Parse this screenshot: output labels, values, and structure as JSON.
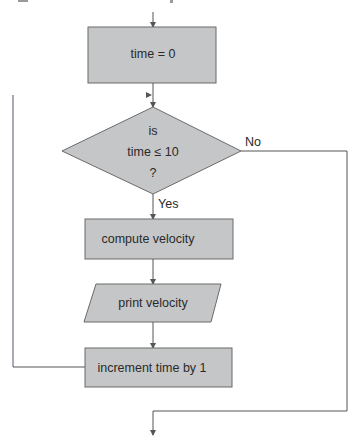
{
  "flowchart": {
    "nodes": {
      "init": {
        "type": "process",
        "label": "time = 0"
      },
      "decision": {
        "type": "decision",
        "line1": "is",
        "line2": "time ≤ 10",
        "line3": "?"
      },
      "compute": {
        "type": "process",
        "label": "compute velocity"
      },
      "print": {
        "type": "input-output",
        "label": "print velocity"
      },
      "increment": {
        "type": "process",
        "label": "increment time by 1"
      }
    },
    "edges": {
      "yes_label": "Yes",
      "no_label": "No"
    },
    "colors": {
      "node_fill": "#c5c6c7",
      "node_stroke": "#6a6a6a",
      "edge": "#555555",
      "text": "#2a2a2a"
    }
  }
}
